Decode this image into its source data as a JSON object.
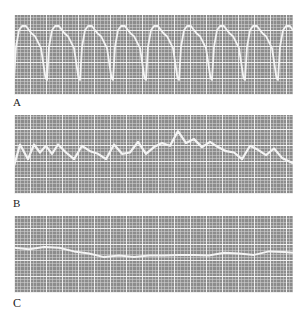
{
  "figure": {
    "panels": [
      {
        "label": "A",
        "description": "Regular high-amplitude periodic waveform"
      },
      {
        "label": "B",
        "description": "Irregular, erratic lower-amplitude waveform"
      },
      {
        "label": "C",
        "description": "Nearly flat, low-amplitude wandering baseline"
      }
    ],
    "colors": {
      "grid_background": "#8c8c8c",
      "grid_lines": "#d2d2d2",
      "trace": "#f4f4f4",
      "label_text": "#222222"
    }
  },
  "chart_data": [
    {
      "type": "line",
      "title": "A",
      "xlabel": "",
      "ylabel": "",
      "grid": true,
      "description": "8 regular cycles, each ~33px wide; rapid upstroke to rounded peak with notch on descending limb, sharp trough",
      "x": [
        0,
        8,
        12,
        16,
        20,
        24,
        28,
        31,
        33,
        41,
        45,
        49,
        53,
        57,
        61,
        64,
        66
      ],
      "values": [
        10,
        88,
        95,
        95,
        85,
        78,
        60,
        15,
        5,
        88,
        95,
        95,
        85,
        78,
        60,
        15,
        5
      ],
      "cycles": 8,
      "ylim": [
        0,
        100
      ]
    },
    {
      "type": "line",
      "title": "B",
      "xlabel": "",
      "ylabel": "",
      "grid": true,
      "description": "Irregular oscillation with varying amplitude, peak near center",
      "x": [
        0,
        6,
        14,
        20,
        26,
        32,
        38,
        44,
        52,
        60,
        68,
        76,
        84,
        92,
        100,
        108,
        116,
        124,
        132,
        140,
        148,
        156,
        164,
        172,
        180,
        188,
        196,
        204,
        212,
        220,
        228,
        236,
        244,
        252,
        260,
        268,
        279
      ],
      "values": [
        30,
        62,
        40,
        62,
        50,
        60,
        48,
        62,
        50,
        40,
        60,
        52,
        48,
        40,
        62,
        48,
        50,
        66,
        48,
        58,
        64,
        60,
        82,
        64,
        70,
        58,
        66,
        58,
        52,
        50,
        40,
        60,
        54,
        46,
        56,
        42,
        34
      ],
      "ylim": [
        0,
        100
      ]
    },
    {
      "type": "line",
      "title": "C",
      "xlabel": "",
      "ylabel": "",
      "grid": true,
      "description": "Low-amplitude slowly drifting trace",
      "x": [
        0,
        15,
        30,
        45,
        60,
        75,
        90,
        105,
        120,
        135,
        150,
        165,
        180,
        195,
        210,
        225,
        240,
        255,
        270,
        279
      ],
      "values": [
        58,
        56,
        59,
        58,
        53,
        50,
        45,
        47,
        45,
        47,
        47,
        48,
        48,
        47,
        51,
        50,
        48,
        53,
        52,
        51
      ],
      "ylim": [
        0,
        100
      ]
    }
  ]
}
